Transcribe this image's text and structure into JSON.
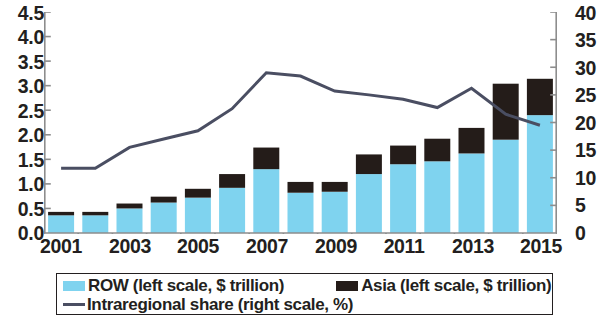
{
  "chart_data": {
    "type": "bar",
    "title": "",
    "subtitle": "",
    "xlabel": "",
    "ylabel": "",
    "grid": false,
    "stacked": true,
    "legend_position": "bottom",
    "x": [
      2001,
      2002,
      2003,
      2004,
      2005,
      2006,
      2007,
      2008,
      2009,
      2010,
      2011,
      2012,
      2013,
      2014,
      2015
    ],
    "categories": [
      "2001",
      "2002",
      "2003",
      "2004",
      "2005",
      "2006",
      "2007",
      "2008",
      "2009",
      "2010",
      "2011",
      "2012",
      "2013",
      "2014",
      "2015"
    ],
    "xtick_labels": [
      "2001",
      "2003",
      "2005",
      "2007",
      "2009",
      "2011",
      "2013",
      "2015"
    ],
    "left_axis": {
      "label": "$ trillion",
      "ylim": [
        0.0,
        4.5
      ],
      "ticks": [
        "0.0",
        "0.5",
        "1.0",
        "1.5",
        "2.0",
        "2.5",
        "3.0",
        "3.5",
        "4.0",
        "4.5"
      ],
      "tick_values": [
        0.0,
        0.5,
        1.0,
        1.5,
        2.0,
        2.5,
        3.0,
        3.5,
        4.0,
        4.5
      ]
    },
    "right_axis": {
      "label": "%",
      "ylim": [
        0,
        40
      ],
      "ticks": [
        "0",
        "5",
        "10",
        "15",
        "20",
        "25",
        "30",
        "35",
        "40"
      ],
      "tick_values": [
        0,
        5,
        10,
        15,
        20,
        25,
        30,
        35,
        40
      ]
    },
    "series": [
      {
        "name": "ROW (left scale, $ trillion)",
        "short_name": "ROW",
        "type": "bar",
        "axis": "left",
        "color": "#7fd3ef",
        "values": [
          0.36,
          0.36,
          0.5,
          0.62,
          0.72,
          0.92,
          1.3,
          0.82,
          0.84,
          1.2,
          1.4,
          1.46,
          1.62,
          1.9,
          2.4
        ]
      },
      {
        "name": "Asia (left scale, $ trillion)",
        "short_name": "Asia",
        "type": "bar",
        "axis": "left",
        "color": "#241c19",
        "values": [
          0.07,
          0.07,
          0.1,
          0.12,
          0.18,
          0.28,
          0.44,
          0.22,
          0.2,
          0.4,
          0.38,
          0.46,
          0.52,
          1.14,
          0.74
        ]
      },
      {
        "name": "Intraregional share  (right scale, %)",
        "short_name": "Intraregional share",
        "type": "line",
        "axis": "right",
        "color": "#4a4e62",
        "values": [
          11.7,
          11.7,
          15.5,
          17.0,
          18.5,
          22.5,
          29.0,
          28.4,
          25.7,
          25.0,
          24.2,
          22.7,
          26.2,
          21.5,
          19.5
        ]
      }
    ],
    "totals": [
      0.43,
      0.43,
      0.6,
      0.74,
      0.9,
      1.2,
      1.74,
      1.04,
      1.04,
      1.6,
      1.78,
      1.92,
      2.14,
      3.04,
      3.14
    ]
  },
  "legend": {
    "row_label": "ROW (left scale, $ trillion)",
    "asia_label": "Asia (left scale, $ trillion)",
    "line_label": "Intraregional share  (right scale, %)"
  },
  "colors": {
    "row_bar": "#7fd3ef",
    "asia_bar": "#241c19",
    "line": "#4a4e62",
    "axis": "#8d8d8d",
    "text": "#231f20",
    "background": "#ffffff"
  }
}
